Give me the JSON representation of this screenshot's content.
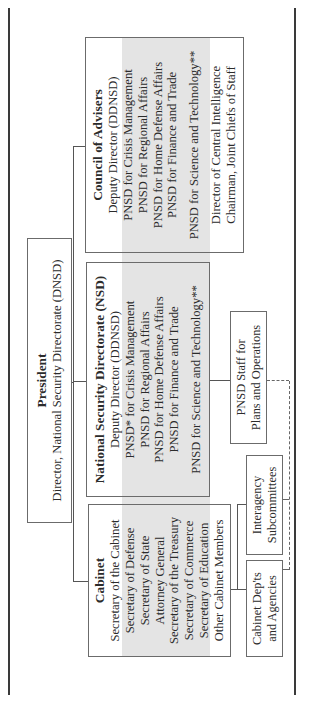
{
  "president": {
    "title": "President",
    "subtitle": "Director, National Security Directorate (DNSD)"
  },
  "council": {
    "title": "Council of Advisers",
    "lines": [
      "Deputy Director (DDNSD)",
      "PNSD for Crisis Management",
      "PNSD for Regional Affairs",
      "PNSD for Home Defense Affairs",
      "PNSD for Finance and Trade"
    ],
    "science": "PNSD for Science and Technology**",
    "extra": [
      "Director of Central Intelligence",
      "Chairman, Joint Chiefs of Staff"
    ]
  },
  "nsd": {
    "title": "National Security Directorate (NSD)",
    "lines": [
      "Deputy Director (DDNSD)",
      "PNSD* for Crisis Management",
      "PNSD for Regional Affairs",
      "PNSD for Home Defense Affairs",
      "PNSD for Finance and Trade"
    ],
    "science": "PNSD for Science and Technology**"
  },
  "cabinet": {
    "title": "Cabinet",
    "lines": [
      "Secretary of the Cabinet",
      "Secretary of Defense",
      "Secretary of State",
      "Attorney General",
      "Secretary of the Treasury",
      "Secretary of Commerce",
      "Secretary of Education",
      "Other Cabinet Members"
    ]
  },
  "pnsd_staff": {
    "lines": [
      "PNSD Staff for",
      "Plans and Operations"
    ]
  },
  "interagency": {
    "lines": [
      "Interagency",
      "Subcommittees"
    ]
  },
  "cabinet_depts": {
    "lines": [
      "Cabinet Dep'ts",
      "and Agencies"
    ]
  }
}
